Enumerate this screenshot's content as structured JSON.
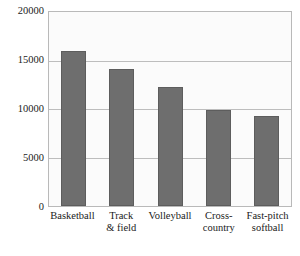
{
  "chart_data": {
    "type": "bar",
    "title": "",
    "xlabel": "",
    "ylabel": "",
    "categories": [
      "Basketball",
      "Track\n& field",
      "Volleyball",
      "Cross-\ncountry",
      "Fast-pitch\nsoftball"
    ],
    "values": [
      16000,
      14100,
      12300,
      9900,
      9300
    ],
    "ylim": [
      0,
      20000
    ],
    "yticks": [
      0,
      5000,
      10000,
      15000,
      20000
    ],
    "ytick_labels": [
      "0",
      "5000",
      "10000",
      "15000",
      "20000"
    ],
    "grid": true,
    "legend": false,
    "bar_color": "#6e6e6e",
    "plot_background": "#fbfbfb",
    "frame_color": "#b9b9b9",
    "gridline_color": "#bdbdbd"
  }
}
